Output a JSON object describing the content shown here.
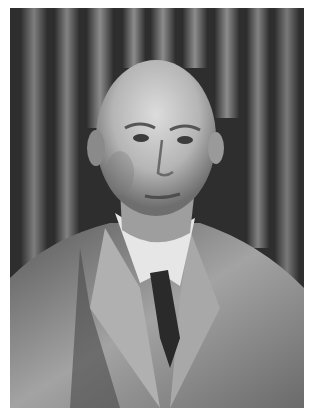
{
  "image": {
    "type": "photograph",
    "style": "black-and-white portrait",
    "subject": "elderly bald man in tweed suit, white shirt, dark tie",
    "background": "bookshelves with vertical book spines",
    "colors": {
      "border": "#ffffff",
      "background_dark": "#2e2e2e",
      "book_light": "#8a8a8a",
      "skin": "#bdbdbd",
      "skin_highlight": "#d8d8d8",
      "jacket": "#9a9a9a",
      "jacket_shadow": "#4a4a4a",
      "shirt": "#e6e6e6",
      "tie": "#2a2a2a"
    }
  }
}
